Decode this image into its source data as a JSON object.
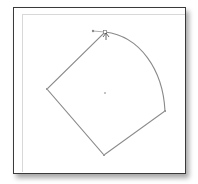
{
  "window": {
    "title": ""
  },
  "canvas": {
    "shape": {
      "type": "closed-path",
      "anchors": [
        {
          "name": "top",
          "x": 105,
          "y": 32,
          "selected": true
        },
        {
          "name": "right",
          "x": 165,
          "y": 111
        },
        {
          "name": "bottom",
          "x": 104,
          "y": 155
        },
        {
          "name": "left",
          "x": 47,
          "y": 89
        }
      ],
      "curve_segment": "top-to-right",
      "handle": {
        "x": 93,
        "y": 31
      },
      "center_point": {
        "x": 105,
        "y": 93
      },
      "stroke_color": "#8a8a8a"
    },
    "cursor": "direct-selection-arrow"
  },
  "colors": {
    "frame_border": "#3a3a3a",
    "artboard_edge": "#d8d8d8",
    "background": "#ffffff"
  }
}
